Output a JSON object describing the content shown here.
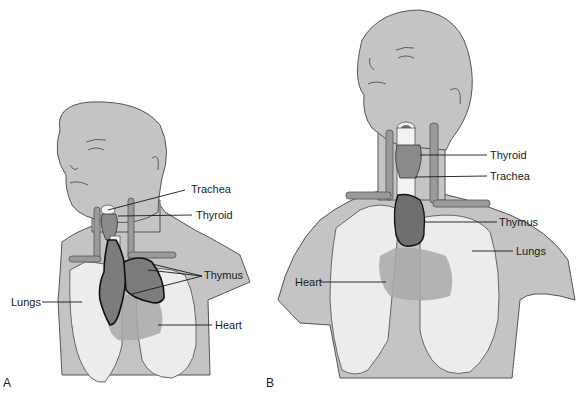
{
  "figure": {
    "panels": [
      {
        "id": "A",
        "panel_label": "A",
        "subject": "infant",
        "labels": {
          "trachea": "Trachea",
          "thyroid": "Thyroid",
          "thymus": "Thymus",
          "lungs": "Lungs",
          "heart": "Heart"
        }
      },
      {
        "id": "B",
        "panel_label": "B",
        "subject": "adult",
        "labels": {
          "thyroid": "Thyroid",
          "trachea": "Trachea",
          "thymus": "Thymus",
          "lungs": "Lungs",
          "heart": "Heart"
        }
      }
    ],
    "colors": {
      "skin": "#c4c4c4",
      "lungs": "#ececec",
      "thymus": "#7c7c7c",
      "heart": "#a9a9a9",
      "background": "#ffffff"
    }
  }
}
